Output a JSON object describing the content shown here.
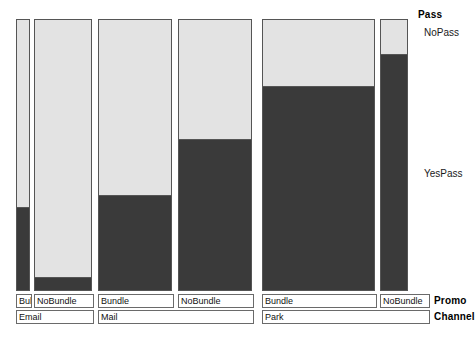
{
  "chart_data": {
    "type": "bar",
    "chart_kind": "mosaic-spine-plot",
    "title": "",
    "xlabel": "",
    "ylabel": "",
    "grid": false,
    "ylim": [
      0,
      1
    ],
    "response_variable": "Pass",
    "response_categories": [
      "NoPass",
      "YesPass"
    ],
    "explanatory_variables": [
      "Promo",
      "Channel"
    ],
    "categories": [
      "Email / Bundle",
      "Email / NoBundle",
      "Mail / Bundle",
      "Mail / NoBundle",
      "Park / Bundle",
      "Park / NoBundle"
    ],
    "series": [
      {
        "name": "NoPass",
        "values": [
          0.7,
          0.955,
          0.655,
          0.448,
          0.254,
          0.136
        ]
      },
      {
        "name": "YesPass",
        "values": [
          0.3,
          0.045,
          0.345,
          0.552,
          0.746,
          0.864
        ]
      }
    ],
    "bar_widths": [
      14,
      58,
      74,
      74,
      113,
      28
    ],
    "legend_position": "right",
    "colors": {
      "nopass": "#e3e3e3",
      "yespass": "#3a3a3a",
      "outline": "#555555",
      "text": "#111111"
    }
  },
  "plot": {
    "bars": [
      {
        "id": "email-bundle",
        "promo": "Bul",
        "channel": "Email",
        "left": 16,
        "width": 14,
        "nopass": 0.7,
        "yespass": 0.3
      },
      {
        "id": "email-nobundle",
        "promo": "NoBundle",
        "channel": "Email",
        "left": 34,
        "width": 58,
        "nopass": 0.955,
        "yespass": 0.045
      },
      {
        "id": "mail-bundle",
        "promo": "Bundle",
        "channel": "Mail",
        "left": 98,
        "width": 74,
        "nopass": 0.655,
        "yespass": 0.345
      },
      {
        "id": "mail-nobundle",
        "promo": "NoBundle",
        "channel": "Mail",
        "left": 178,
        "width": 74,
        "nopass": 0.448,
        "yespass": 0.552
      },
      {
        "id": "park-bundle",
        "promo": "Bundle",
        "channel": "Park",
        "left": 262,
        "width": 113,
        "nopass": 0.254,
        "yespass": 0.746
      },
      {
        "id": "park-nobundle",
        "promo": "NoBundle",
        "channel": "Park",
        "left": 380,
        "width": 28,
        "nopass": 0.136,
        "yespass": 0.864
      }
    ]
  },
  "legend": {
    "variable_label": "Pass",
    "category_nopass": "NoPass",
    "category_yespass": "YesPass"
  },
  "axis": {
    "promo_var_label": "Promo",
    "channel_var_label": "Channel",
    "promo_boxes": [
      {
        "label": "Bul",
        "left": 16,
        "width": 16
      },
      {
        "label": "NoBundle",
        "left": 34,
        "width": 60
      },
      {
        "label": "Bundle",
        "left": 98,
        "width": 76
      },
      {
        "label": "NoBundle",
        "left": 178,
        "width": 76
      },
      {
        "label": "Bundle",
        "left": 262,
        "width": 115
      },
      {
        "label": "NoBundle",
        "left": 380,
        "width": 50
      }
    ],
    "channel_boxes": [
      {
        "label": "Email",
        "left": 16,
        "width": 78
      },
      {
        "label": "Mail",
        "left": 98,
        "width": 156
      },
      {
        "label": "Park",
        "left": 262,
        "width": 168
      }
    ]
  }
}
